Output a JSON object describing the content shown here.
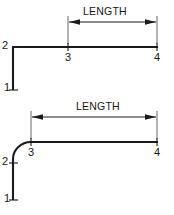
{
  "diagram": {
    "type": "engineering-dimension-sketch",
    "colors": {
      "geometry": "#1a1a1a",
      "dimension": "#1a1a1a",
      "extension": "#58585a",
      "background": "#ffffff"
    },
    "figures": [
      {
        "id": "figure-sharp-corner",
        "caption": "Sharp corner variant",
        "corner": "sharp",
        "dimension": {
          "label": "LENGTH",
          "from_node": "3",
          "to_node": "4"
        },
        "nodes": [
          {
            "id": "1",
            "label": "1",
            "x": 13,
            "y": 90
          },
          {
            "id": "2",
            "label": "2",
            "x": 13,
            "y": 47
          },
          {
            "id": "3",
            "label": "3",
            "x": 68,
            "y": 47
          },
          {
            "id": "4",
            "label": "4",
            "x": 157,
            "y": 47
          }
        ]
      },
      {
        "id": "figure-filleted-corner",
        "caption": "Filleted (rounded) corner variant",
        "corner": "rounded",
        "fillet_radius": 17,
        "dimension": {
          "label": "LENGTH",
          "from_node": "3",
          "to_node": "4"
        },
        "nodes": [
          {
            "id": "1",
            "label": "1",
            "x": 13,
            "y": 200
          },
          {
            "id": "2",
            "label": "2",
            "x": 13,
            "y": 163
          },
          {
            "id": "3",
            "label": "3",
            "x": 31,
            "y": 142
          },
          {
            "id": "4",
            "label": "4",
            "x": 157,
            "y": 142
          }
        ]
      }
    ],
    "labels": {
      "top": {
        "length": "LENGTH",
        "node1": "1",
        "node2": "2",
        "node3": "3",
        "node4": "4"
      },
      "bottom": {
        "length": "LENGTH",
        "node1": "1",
        "node2": "2",
        "node3": "3",
        "node4": "4"
      }
    }
  }
}
